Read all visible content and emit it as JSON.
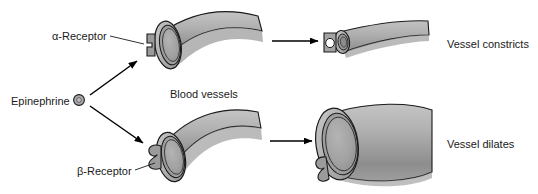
{
  "figure": {
    "background_color": "#ffffff",
    "text_color": "#1a1a1a",
    "vessel_fill_light": "#b3b3b3",
    "vessel_fill_mid": "#9a9a9a",
    "vessel_fill_dark": "#8a8a8a",
    "lumen_fill": "#a6a6a6",
    "outline_color": "#1a1a1a",
    "arrow_color": "#000000"
  },
  "labels": {
    "alpha_receptor": "α-Receptor",
    "beta_receptor": "β-Receptor",
    "epinephrine": "Epinephrine",
    "blood_vessels": "Blood vessels",
    "vessel_constricts": "Vessel constricts",
    "vessel_dilates": "Vessel dilates"
  },
  "icons": {
    "epinephrine_molecule": "epinephrine-molecule-icon",
    "alpha_receptor_shape": "alpha-receptor-icon",
    "beta_receptor_shape": "beta-receptor-icon",
    "upper_branch_arrow": "arrow-up-right-icon",
    "lower_branch_arrow": "arrow-down-right-icon",
    "constrict_arrow": "arrow-right-icon",
    "dilate_arrow": "arrow-right-icon"
  },
  "diagram_flow": {
    "source": "Epinephrine",
    "branches": [
      {
        "receptor": "α-Receptor",
        "target": "Blood vessels",
        "outcome": "Vessel constricts"
      },
      {
        "receptor": "β-Receptor",
        "target": "Blood vessels",
        "outcome": "Vessel dilates"
      }
    ]
  }
}
